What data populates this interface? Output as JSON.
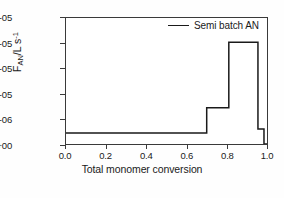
{
  "chart_data": {
    "type": "line",
    "title": "",
    "xlabel": "Total monomer conversion",
    "ylabel": "F_AN/L s^-1",
    "ylabel_parts": {
      "base": "F",
      "subscript": "AN",
      "middle": "/L s",
      "superscript": "-1"
    },
    "xlim": [
      0.0,
      1.0
    ],
    "ylim": [
      0.0,
      2.5e-05
    ],
    "xticks": [
      "0.0",
      "0.2",
      "0.4",
      "0.6",
      "0.8",
      "1.0"
    ],
    "xtick_values": [
      0.0,
      0.2,
      0.4,
      0.6,
      0.8,
      1.0
    ],
    "yticks": [
      "0.0E+00",
      "5.0E-06",
      "1.0E-05",
      "1.5E-05",
      "2.0E-05",
      "2.5E-05"
    ],
    "ytick_values": [
      0.0,
      5e-06,
      1e-05,
      1.5e-05,
      2e-05,
      2.5e-05
    ],
    "grid": false,
    "legend_position": "top-right",
    "series": [
      {
        "name": "Semi batch AN",
        "color": "#1a1a1a",
        "style": "step",
        "x": [
          0.0,
          0.7,
          0.7,
          0.81,
          0.81,
          0.955,
          0.955,
          0.985,
          0.985,
          1.0
        ],
        "y": [
          2.2e-06,
          2.2e-06,
          7.2e-06,
          7.2e-06,
          2.02e-05,
          2.02e-05,
          3e-06,
          3e-06,
          0.0,
          0.0
        ]
      }
    ],
    "annotations": []
  },
  "legend": {
    "entries": [
      {
        "label": "Semi batch AN",
        "color": "#1a1a1a"
      }
    ]
  }
}
